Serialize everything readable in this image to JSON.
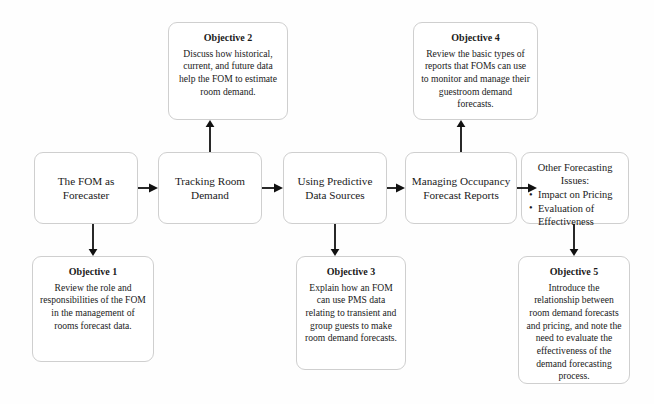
{
  "diagram": {
    "type": "process-flow",
    "border_color": "#cfcfcf",
    "arrow_color": "#111111",
    "background": "#fefefe"
  },
  "stages": [
    {
      "id": "stage-1",
      "lines": [
        "The FOM as",
        "Forecaster"
      ]
    },
    {
      "id": "stage-2",
      "lines": [
        "Tracking Room",
        "Demand"
      ]
    },
    {
      "id": "stage-3",
      "lines": [
        "Using Predictive",
        "Data Sources"
      ]
    },
    {
      "id": "stage-4",
      "lines": [
        "Managing Occupancy",
        "Forecast Reports"
      ]
    }
  ],
  "issues_box": {
    "id": "stage-5",
    "heading_line_1": "Other Forecasting",
    "heading_line_2": "Issues:",
    "bullets": [
      "Impact on Pricing",
      "Evaluation of Effectiveness"
    ]
  },
  "objectives": [
    {
      "id": "objective-1",
      "title": "Objective 1",
      "body": "Review the role and responsibilities of the FOM in the management of rooms forecast data."
    },
    {
      "id": "objective-2",
      "title": "Objective 2",
      "body": "Discuss how historical, current, and future data help the FOM to estimate room demand."
    },
    {
      "id": "objective-3",
      "title": "Objective 3",
      "body": "Explain how an FOM can use PMS data relating to transient and group guests to make room demand forecasts."
    },
    {
      "id": "objective-4",
      "title": "Objective 4",
      "body": "Review the basic types of reports that FOMs can use to monitor and manage their guestroom demand forecasts."
    },
    {
      "id": "objective-5",
      "title": "Objective 5",
      "body": "Introduce the relationship between room demand forecasts and pricing, and note the need to evaluate the effectiveness of the demand forecasting process."
    }
  ]
}
